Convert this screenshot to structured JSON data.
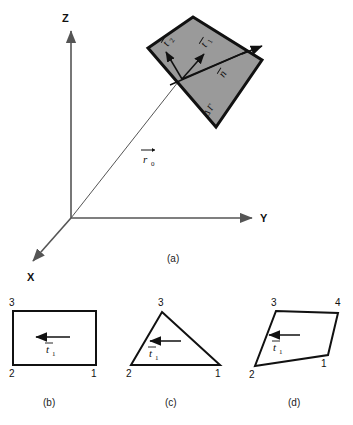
{
  "figure": {
    "background_color": "#ffffff",
    "ink_color": "#111111",
    "surface_fill": "#9a9a9a",
    "axis_color": "#555555"
  },
  "panel_a": {
    "caption": "(a)",
    "axes": {
      "z_label": "Z",
      "y_label": "Y",
      "x_label": "X"
    },
    "position_vector": {
      "symbol": "r",
      "subscript": "0",
      "accent": "arrow"
    },
    "surface": {
      "area_label_delta": "Δ",
      "area_label_gamma": "Γ",
      "fill_color": "#9a9a9a",
      "edge_color": "#111111"
    },
    "vectors": [
      {
        "name": "tangent-1",
        "symbol": "t",
        "subscript": "1",
        "accent": "bar"
      },
      {
        "name": "tangent-2",
        "symbol": "t",
        "subscript": "2",
        "accent": "bar"
      },
      {
        "name": "normal",
        "symbol": "n",
        "subscript": "",
        "accent": "bar"
      }
    ]
  },
  "panel_b": {
    "caption": "(b)",
    "shape": "quadrilateral-rectangle",
    "nodes": [
      "3",
      "2",
      "1"
    ],
    "tangent": {
      "symbol": "t",
      "subscript": "1",
      "accent": "bar"
    }
  },
  "panel_c": {
    "caption": "(c)",
    "shape": "triangle",
    "nodes": [
      "3",
      "2",
      "1"
    ],
    "tangent": {
      "symbol": "t",
      "subscript": "1",
      "accent": "bar"
    }
  },
  "panel_d": {
    "caption": "(d)",
    "shape": "irregular-quadrilateral",
    "nodes": [
      "3",
      "4",
      "2",
      "1"
    ],
    "tangent": {
      "symbol": "t",
      "subscript": "1",
      "accent": "bar"
    }
  }
}
